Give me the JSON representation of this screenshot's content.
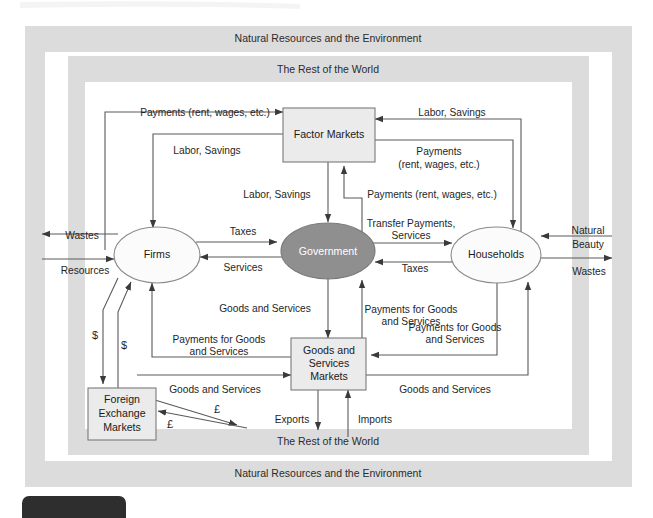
{
  "diagram": {
    "bands": {
      "outer_top": "Natural Resources and the Environment",
      "outer_bottom": "Natural Resources and the Environment",
      "inner_top": "The Rest of the World",
      "inner_bottom": "The Rest of the World"
    },
    "nodes": {
      "factor_markets": "Factor Markets",
      "firms": "Firms",
      "government": "Government",
      "households": "Households",
      "goods_services_markets_line1": "Goods and",
      "goods_services_markets_line2": "Services",
      "goods_services_markets_line3": "Markets",
      "foreign_exchange_line1": "Foreign",
      "foreign_exchange_line2": "Exchange",
      "foreign_exchange_line3": "Markets"
    },
    "colors": {
      "band": "#dcdcdc",
      "government_fill": "#8f8f8f",
      "box_fill": "#ebebeb",
      "line": "#5a5a5a",
      "text": "#1f1f1f",
      "page_background": "#ffffff"
    },
    "flows": {
      "payments_rent_wages_top_left": "Payments (rent, wages, etc.)",
      "labor_savings_top_left": "Labor, Savings",
      "labor_savings_top_right": "Labor, Savings",
      "payments_top_right_line1": "Payments",
      "payments_top_right_line2": "(rent, wages, etc.)",
      "labor_savings_center": "Labor, Savings",
      "payments_rent_wages_center_right": "Payments (rent, wages, etc.)",
      "wastes_left": "Wastes",
      "resources_left": "Resources",
      "taxes_firms": "Taxes",
      "services_firms": "Services",
      "transfer_payments_line1": "Transfer Payments,",
      "transfer_payments_line2": "Services",
      "taxes_households": "Taxes",
      "natural_beauty_line1": "Natural",
      "natural_beauty_line2": "Beauty",
      "wastes_right": "Wastes",
      "goods_and_services_center": "Goods and Services",
      "payments_for_goods_center_line1": "Payments for Goods",
      "payments_for_goods_center_line2": "and Services",
      "payments_for_goods_left_line1": "Payments for Goods",
      "payments_for_goods_left_line2": "and Services",
      "payments_for_goods_right_line1": "Payments for Goods",
      "payments_for_goods_right_line2": "and Services",
      "goods_and_services_left": "Goods and Services",
      "goods_and_services_right": "Goods and Services",
      "dollar_out": "$",
      "dollar_in": "$",
      "pound_out": "£",
      "pound_in": "£",
      "exports": "Exports",
      "imports": "Imports"
    }
  }
}
